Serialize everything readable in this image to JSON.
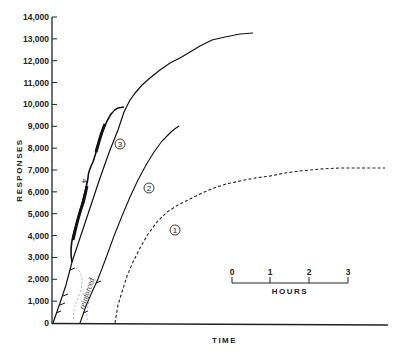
{
  "chart_data": {
    "type": "line",
    "title": "",
    "xlabel": "TIME",
    "ylabel": "RESPONSES",
    "ylim": [
      0,
      14000
    ],
    "yticks": [
      0,
      1000,
      2000,
      3000,
      4000,
      5000,
      6000,
      7000,
      8000,
      9000,
      10000,
      11000,
      12000,
      13000,
      14000
    ],
    "ytick_labels": [
      "0",
      "1,000",
      "2,000",
      "3,000",
      "4,000",
      "5,000",
      "6,000",
      "7,000",
      "8,000",
      "9,000",
      "10,000",
      "11,000",
      "12,000",
      "13,000",
      "14,000"
    ],
    "grid": false,
    "legend": "none (curves labeled inline with circled numbers)",
    "time_scale_bar": {
      "label": "HOURS",
      "ticks": [
        "0",
        "1",
        "2",
        "3"
      ]
    },
    "annotations": [
      "reinforced"
    ],
    "series": [
      {
        "name": "1",
        "style": "dashed",
        "x_hours": [
          0.0,
          0.3,
          0.7,
          1.2,
          1.8,
          2.5,
          3.5,
          4.9,
          6.2,
          7.1
        ],
        "values": [
          0,
          1700,
          3600,
          4900,
          5700,
          6300,
          6600,
          6900,
          7100,
          7100
        ]
      },
      {
        "name": "2",
        "style": "solid",
        "x_hours": [
          0.0,
          0.5,
          1.0,
          1.4,
          1.8,
          2.3,
          2.5
        ],
        "values": [
          0,
          2000,
          4500,
          6400,
          7500,
          8500,
          9100
        ]
      },
      {
        "name": "3",
        "style": "solid",
        "x_hours": [
          0.0,
          0.5,
          1.2,
          1.6,
          1.9,
          2.3,
          3.0,
          4.1,
          4.9,
          5.2
        ],
        "values": [
          0,
          3000,
          6800,
          8600,
          9900,
          10900,
          11900,
          12800,
          13200,
          13300
        ]
      },
      {
        "name": "4",
        "style": "solid-thick",
        "x_hours": [
          0.5,
          0.6,
          0.8,
          1.0,
          1.1,
          1.3,
          1.6,
          1.9
        ],
        "values": [
          3000,
          4100,
          5600,
          6500,
          7200,
          8300,
          9500,
          9900
        ]
      }
    ]
  },
  "labels": {
    "y_axis_title": "RESPONSES",
    "x_axis_title": "TIME",
    "scale_bar_title": "HOURS",
    "scale_ticks": [
      "0",
      "1",
      "2",
      "3"
    ],
    "y_ticks": [
      "0",
      "1,000",
      "2,000",
      "3,000",
      "4,000",
      "5,000",
      "6,000",
      "7,000",
      "8,000",
      "9,000",
      "10,000",
      "11,000",
      "12,000",
      "13,000",
      "14,000"
    ],
    "curve_labels": [
      "1",
      "2",
      "3",
      "4"
    ],
    "reinforced_note": "reinforced"
  }
}
